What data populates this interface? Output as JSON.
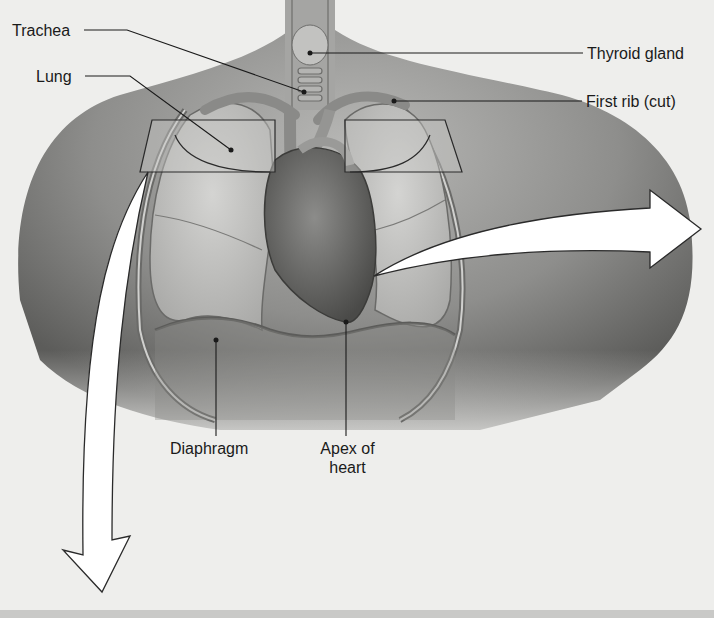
{
  "figure": {
    "colors": {
      "background": "#eeeeec",
      "skin_dark": "#5a5a5a",
      "skin_mid": "#9a9a98",
      "lung": "#bdbdbb",
      "heart": "#6e6e6c",
      "leader_line": "#1a1a1a",
      "arrow_fill": "#ffffff",
      "arrow_stroke": "#2a2a2a",
      "footer_band": "#c9c9c7"
    }
  },
  "labels": {
    "trachea": "Trachea",
    "lung": "Lung",
    "thyroid_gland": "Thyroid gland",
    "first_rib": "First rib (cut)",
    "diaphragm": "Diaphragm",
    "apex_line1": "Apex of",
    "apex_line2": "heart"
  },
  "arrows": [
    {
      "name": "arrow-right",
      "direction": "right"
    },
    {
      "name": "arrow-down",
      "direction": "down"
    }
  ],
  "section_planes": [
    {
      "name": "left-section-plane"
    },
    {
      "name": "right-section-plane"
    }
  ]
}
